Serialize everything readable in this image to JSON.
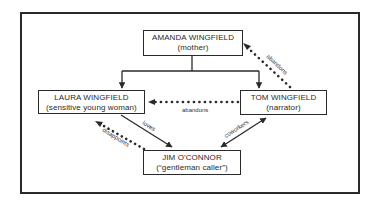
{
  "diagram": {
    "type": "character relationship diagram",
    "nodes": [
      {
        "id": "amanda",
        "name": "AMANDA WINGFIELD",
        "role": "(mother)"
      },
      {
        "id": "laura",
        "name": "LAURA WINGFIELD",
        "role": "(sensitive young woman)"
      },
      {
        "id": "tom",
        "name": "TOM WINGFIELD",
        "role": "(narrator)"
      },
      {
        "id": "jim",
        "name": "JIM O'CONNOR",
        "role": "(“gentleman caller”)"
      }
    ],
    "edges": [
      {
        "from": "amanda",
        "to": "laura",
        "style": "solid",
        "label": ""
      },
      {
        "from": "amanda",
        "to": "tom",
        "style": "solid",
        "label": ""
      },
      {
        "from": "tom",
        "to": "amanda",
        "style": "dotted",
        "label": "abandons"
      },
      {
        "from": "tom",
        "to": "laura",
        "style": "dotted",
        "label": "abandons"
      },
      {
        "from": "laura",
        "to": "jim",
        "style": "solid",
        "label": "loves"
      },
      {
        "from": "jim",
        "to": "laura",
        "style": "dotted",
        "label": "disappoints"
      },
      {
        "from": "tom",
        "to": "jim",
        "style": "solid-bidirectional",
        "label": "coworkers"
      }
    ],
    "colors": {
      "line": "#2a2a2a",
      "background": "#ffffff"
    }
  }
}
